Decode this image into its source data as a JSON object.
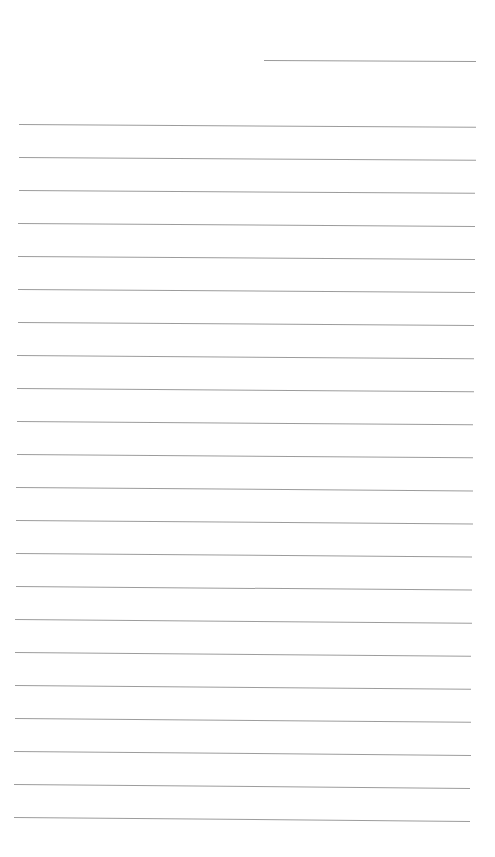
{
  "page": {
    "type": "ruled-notebook-paper",
    "background_color": "#ffffff",
    "line_color": "#9c9c9c",
    "date_line": {
      "label": "",
      "value": ""
    },
    "line_count": 22,
    "line_spacing_px": 33,
    "lines": [
      {
        "text": ""
      },
      {
        "text": ""
      },
      {
        "text": ""
      },
      {
        "text": ""
      },
      {
        "text": ""
      },
      {
        "text": ""
      },
      {
        "text": ""
      },
      {
        "text": ""
      },
      {
        "text": ""
      },
      {
        "text": ""
      },
      {
        "text": ""
      },
      {
        "text": ""
      },
      {
        "text": ""
      },
      {
        "text": ""
      },
      {
        "text": ""
      },
      {
        "text": ""
      },
      {
        "text": ""
      },
      {
        "text": ""
      },
      {
        "text": ""
      },
      {
        "text": ""
      },
      {
        "text": ""
      },
      {
        "text": ""
      }
    ]
  }
}
